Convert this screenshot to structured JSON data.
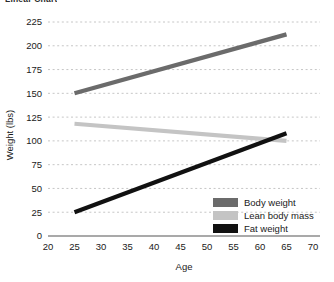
{
  "cut_off_header": "Linear Chart",
  "chart_data": {
    "type": "line",
    "title": "",
    "xlabel": "Age",
    "ylabel": "Weight (lbs)",
    "xlim": [
      20,
      70
    ],
    "ylim": [
      0,
      225
    ],
    "xticks": [
      20,
      25,
      30,
      35,
      40,
      45,
      50,
      55,
      60,
      65,
      70
    ],
    "yticks": [
      0,
      25,
      50,
      75,
      100,
      125,
      150,
      175,
      200,
      225
    ],
    "grid": "horizontal-dashed",
    "legend_position": "bottom-right",
    "x": [
      25,
      65
    ],
    "series": [
      {
        "name": "Body weight",
        "values": [
          150,
          212
        ],
        "color": "#6b6b6b"
      },
      {
        "name": "Lean body mass",
        "values": [
          118,
          100
        ],
        "color": "#c4c4c4"
      },
      {
        "name": "Fat weight",
        "values": [
          25,
          108
        ],
        "color": "#111111"
      }
    ]
  },
  "legend": {
    "items": [
      {
        "label": "Body weight",
        "color": "#6b6b6b"
      },
      {
        "label": "Lean body mass",
        "color": "#c4c4c4"
      },
      {
        "label": "Fat weight",
        "color": "#111111"
      }
    ]
  },
  "colors": {
    "grid": "#bfbfbf",
    "axis": "#555555",
    "text": "#1a1a1a",
    "background": "#ffffff"
  }
}
